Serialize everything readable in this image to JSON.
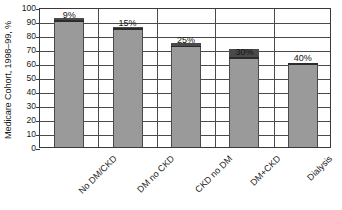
{
  "chart_data": {
    "type": "bar",
    "title": "",
    "xlabel": "",
    "ylabel": "Medicare Cohort, 1998–99, %",
    "categories": [
      "No DM/CKD",
      "DM no CKD",
      "CKD no DM",
      "DM+CKD",
      "Dialysis"
    ],
    "values": [
      91,
      85,
      73,
      64,
      60
    ],
    "data_labels": [
      "9%",
      "15%",
      "25%",
      "30%",
      "40%"
    ],
    "series": [
      {
        "name": "Remaining cohort",
        "values": [
          91,
          85,
          73,
          64,
          60
        ]
      }
    ],
    "marker_bands": [
      {
        "category": "No DM/CKD",
        "from": 91,
        "to": 92
      },
      {
        "category": "DM no CKD",
        "from": 85,
        "to": 86
      },
      {
        "category": "CKD no DM",
        "from": 72,
        "to": 74
      },
      {
        "category": "DM+CKD",
        "from": 64,
        "to": 70
      },
      {
        "category": "Dialysis",
        "from": 60,
        "to": 60
      }
    ],
    "ylim": [
      0,
      100
    ],
    "yticks": [
      0,
      10,
      20,
      30,
      40,
      50,
      60,
      70,
      80,
      90,
      100
    ],
    "ytick_labels": [
      "0",
      "10",
      "20",
      "30",
      "40",
      "50",
      "60",
      "70",
      "80",
      "90",
      "100"
    ],
    "grid": true,
    "grid_axis": "both",
    "legend": false,
    "legend_position": "none",
    "bar_color": "#9a9a9a",
    "band_color": "#4a4a4a",
    "axis_color": "#3a3a3a",
    "grid_color": "#4a4a4a",
    "background_color": "#ffffff"
  }
}
